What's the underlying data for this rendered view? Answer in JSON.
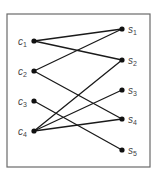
{
  "diagram": {
    "type": "bipartite-graph",
    "frame": {
      "x": 7,
      "y": 14,
      "width": 143,
      "height": 153,
      "stroke": "#6a6a6a"
    },
    "colors": {
      "edge": "#1a1a1a",
      "node": "#111111",
      "label": "#444444"
    },
    "left_nodes": [
      {
        "id": "c1",
        "base": "c",
        "sub": "1",
        "x": 34,
        "y": 41
      },
      {
        "id": "c2",
        "base": "c",
        "sub": "2",
        "x": 34,
        "y": 71
      },
      {
        "id": "c3",
        "base": "c",
        "sub": "3",
        "x": 34,
        "y": 101
      },
      {
        "id": "c4",
        "base": "c",
        "sub": "4",
        "x": 34,
        "y": 131
      }
    ],
    "right_nodes": [
      {
        "id": "s1",
        "base": "s",
        "sub": "1",
        "x": 122,
        "y": 29
      },
      {
        "id": "s2",
        "base": "s",
        "sub": "2",
        "x": 122,
        "y": 60
      },
      {
        "id": "s3",
        "base": "s",
        "sub": "3",
        "x": 122,
        "y": 90
      },
      {
        "id": "s4",
        "base": "s",
        "sub": "4",
        "x": 122,
        "y": 119
      },
      {
        "id": "s5",
        "base": "s",
        "sub": "5",
        "x": 122,
        "y": 150
      }
    ],
    "edges": [
      {
        "from": "c1",
        "to": "s1"
      },
      {
        "from": "c1",
        "to": "s2"
      },
      {
        "from": "c2",
        "to": "s1"
      },
      {
        "from": "c2",
        "to": "s4"
      },
      {
        "from": "c3",
        "to": "s5"
      },
      {
        "from": "c4",
        "to": "s2"
      },
      {
        "from": "c4",
        "to": "s3"
      },
      {
        "from": "c4",
        "to": "s4"
      }
    ]
  }
}
